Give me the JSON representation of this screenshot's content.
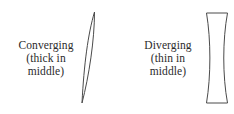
{
  "figure": {
    "background_color": "#ffffff",
    "stroke_color": "#4a4a4a",
    "text_color": "#2b2b2b",
    "width": 234,
    "height": 114
  },
  "items": [
    {
      "id": "converging",
      "label_lines": [
        "Converging",
        "(thick in",
        "middle)"
      ],
      "lens_shape_name": "biconvex-lens",
      "lens_description": "thick in middle"
    },
    {
      "id": "diverging",
      "label_lines": [
        "Diverging",
        "(thin in",
        "middle)"
      ],
      "lens_shape_name": "biconcave-lens",
      "lens_description": "thin in middle"
    }
  ]
}
